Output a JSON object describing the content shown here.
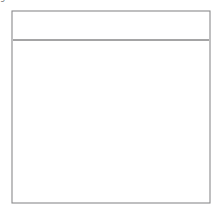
{
  "figure": {
    "kind": "sewing-technique-illustration",
    "background_color": "#ffffff"
  },
  "frame": {
    "name": "illustration-border",
    "x": 12,
    "y": 11,
    "width": 198,
    "height": 192,
    "stroke_color": "#8a8a8c",
    "stroke_width": 1.1
  },
  "caption": {
    "line1": "Press between",
    "line2": "gathers",
    "x": 25,
    "line1_y": 111,
    "line2_y": 123,
    "color": "#6e6e70",
    "font_size": 8.2
  },
  "band": {
    "name": "flat-waistband",
    "top_y": 11,
    "bottom_y": 40,
    "stroke_color": "#4a4a4c",
    "stroke_width": 1.0
  },
  "stitch_line": {
    "name": "basting-stitch-line",
    "y": 66,
    "x_start": 13,
    "x_end": 209,
    "dash": "5,4",
    "stroke_color": "#3f3f42",
    "stroke_width": 1.0
  },
  "gather_scallops": {
    "stroke_color": "#3f3f42",
    "stroke_width": 1.0,
    "path": "M13,40 q4,7 8,0 q4,8 8,-1 q5,7 9,0 q3,8 8,0 q4,6 8,-1 q5,9 10,0 q4,7 8,-1 q4,8 9,0 q5,6 9,-1 q4,9 9,0 q4,6 8,-1 q5,8 9,0 q4,7 9,-1 q4,8 9,0 q4,6 8,-1 q5,8 9,0 q4,7 8,-1 q5,7 9,0 q4,7 8,-1 q5,8 9,0 q3,6 7,-1 q4,7 8,0 q3,6 6,-1 L209,40"
  },
  "gather_folds": {
    "stroke_color": "#7b7b7e",
    "stroke_width": 0.85,
    "lines": [
      {
        "x1": 21,
        "y1": 43,
        "x2": 27,
        "y2": 79
      },
      {
        "x1": 29,
        "y1": 45,
        "x2": 33,
        "y2": 72
      },
      {
        "x1": 37,
        "y1": 43,
        "x2": 42,
        "y2": 84
      },
      {
        "x1": 45,
        "y1": 46,
        "x2": 48,
        "y2": 70
      },
      {
        "x1": 53,
        "y1": 44,
        "x2": 59,
        "y2": 92
      },
      {
        "x1": 62,
        "y1": 45,
        "x2": 66,
        "y2": 75
      },
      {
        "x1": 70,
        "y1": 43,
        "x2": 74,
        "y2": 88
      },
      {
        "x1": 79,
        "y1": 45,
        "x2": 82,
        "y2": 71
      },
      {
        "x1": 87,
        "y1": 44,
        "x2": 93,
        "y2": 90
      },
      {
        "x1": 96,
        "y1": 45,
        "x2": 99,
        "y2": 73
      },
      {
        "x1": 104,
        "y1": 43,
        "x2": 110,
        "y2": 86
      },
      {
        "x1": 113,
        "y1": 46,
        "x2": 116,
        "y2": 70
      },
      {
        "x1": 121,
        "y1": 44,
        "x2": 127,
        "y2": 88
      },
      {
        "x1": 130,
        "y1": 45,
        "x2": 134,
        "y2": 74
      },
      {
        "x1": 138,
        "y1": 43,
        "x2": 144,
        "y2": 83
      },
      {
        "x1": 147,
        "y1": 46,
        "x2": 150,
        "y2": 71
      },
      {
        "x1": 156,
        "y1": 44,
        "x2": 162,
        "y2": 86
      },
      {
        "x1": 164,
        "y1": 45,
        "x2": 167,
        "y2": 72
      },
      {
        "x1": 172,
        "y1": 43,
        "x2": 178,
        "y2": 89
      },
      {
        "x1": 181,
        "y1": 46,
        "x2": 184,
        "y2": 70
      },
      {
        "x1": 189,
        "y1": 44,
        "x2": 194,
        "y2": 85
      },
      {
        "x1": 198,
        "y1": 45,
        "x2": 201,
        "y2": 73
      }
    ]
  },
  "iron_tip": {
    "name": "iron-tip-outline",
    "apex_x": 152,
    "apex_y": 78,
    "left_foot_x": 63,
    "left_foot_y": 203,
    "right_edge_x": 210,
    "right_edge_y": 190,
    "stroke_color": "#5a5a5d",
    "stroke_width": 1.1,
    "path": "M63,203 C66,168 84,130 108,108 C124,93 142,82 152,78 C160,88 178,124 192,154 C199,169 206,182 210,190"
  }
}
